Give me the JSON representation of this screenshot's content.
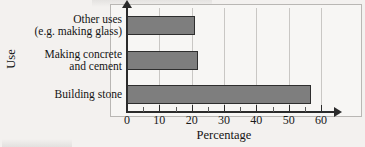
{
  "chart_data": {
    "type": "bar",
    "orientation": "horizontal",
    "title": "",
    "xlabel": "Percentage",
    "ylabel": "Use",
    "categories": [
      "Building stone",
      "Making concrete\nand cement",
      "Other uses\n(e.g. making glass)"
    ],
    "values": [
      57,
      22,
      21
    ],
    "xlim": [
      0,
      60
    ],
    "xticks": [
      0,
      10,
      20,
      30,
      40,
      50,
      60
    ],
    "xticklabels": [
      "0",
      "10",
      "20",
      "30",
      "40",
      "50",
      "60"
    ],
    "grid": "vertical",
    "legend": "none",
    "bar_color": "#7e7e7e",
    "bar_edge_color": "#2e2e2e",
    "axis_color": "#2b2b2b",
    "grid_color": "#c9c7c4",
    "background_color": "#f3f1ef",
    "plot_background_color": "#f7f6f4"
  }
}
